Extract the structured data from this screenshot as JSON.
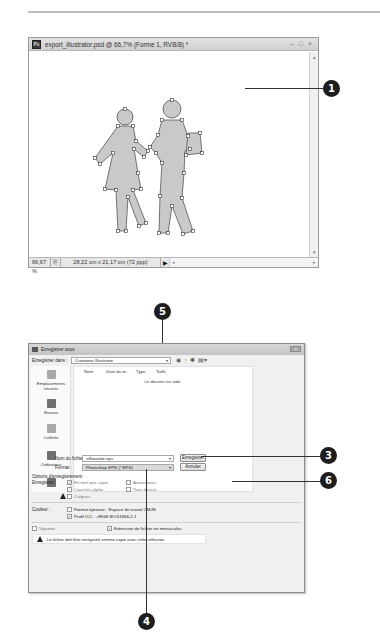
{
  "doc_window": {
    "title": "export_illustrator.psd @ 66,7% (Forme 1, RVB/8) *",
    "app_icon": "Ps",
    "controls": {
      "minimize": "–",
      "maximize": "□",
      "close": "×"
    },
    "status": {
      "zoom": "66,67 %",
      "doc_size": "28,22 cm x 21,17 cm (72 ppp)",
      "play_icon": "▶",
      "scroll_left": "◂",
      "scroll_right": "▸"
    },
    "scroll_up": "▴",
    "scroll_down": "▾"
  },
  "callouts": {
    "c1": "1",
    "c3": "3",
    "c4": "4",
    "c5": "5",
    "c6": "6"
  },
  "save_dialog": {
    "title": "Enregistrer sous",
    "close_label": "✕",
    "save_in_label": "Enregistrer dans :",
    "save_in_value": "Creations Illustrator",
    "toolbar_icons": [
      "back-icon",
      "up-folder-icon",
      "new-folder-icon",
      "view-menu-icon"
    ],
    "toolbar_glyphs": [
      "◉",
      "↑",
      "✱",
      "▤▾"
    ],
    "places": [
      {
        "label": "Emplacements récents"
      },
      {
        "label": "Bureau"
      },
      {
        "label": "Collette"
      },
      {
        "label": "Ordinateur"
      },
      {
        "label": ""
      }
    ],
    "columns": [
      "Nom",
      "Date de m...",
      "Type",
      "Taille"
    ],
    "empty_message": "Le dossier est vide.",
    "file_name_label": "Nom du fichier :",
    "file_name_value": "silhouette.eps",
    "format_label": "Format :",
    "format_value": "Photoshop EPS (*.EPS)",
    "save_button": "Enregistrer",
    "cancel_button": "Annuler",
    "options_label": "Options d'enregistrement",
    "save_label": "Enregistrer :",
    "options": [
      {
        "label": "En tant que copie",
        "checked": true,
        "enabled": false
      },
      {
        "label": "Annotations",
        "checked": false,
        "enabled": false
      },
      {
        "label": "Couches alpha",
        "checked": false,
        "enabled": false
      },
      {
        "label": "Tons directs",
        "checked": false,
        "enabled": false
      },
      {
        "label": "Calques",
        "checked": false,
        "enabled": false
      }
    ],
    "color_label": "Couleur :",
    "color_options": [
      {
        "label": "Format épreuve : Espace de travail CMJN",
        "checked": false
      },
      {
        "label": "Profil ICC : sRGB IEC61966-2.1",
        "checked": true
      }
    ],
    "thumbnail_label": "Vignette",
    "extension_label": "Extension de fichier en minuscules",
    "extension_checked": true,
    "warning_message": "Le fichier doit être enregistré comme copie avec cette sélection."
  }
}
